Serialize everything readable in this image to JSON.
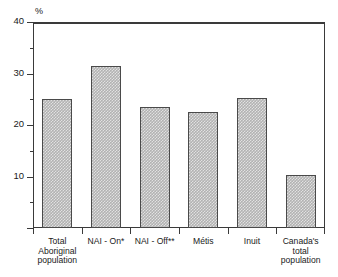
{
  "chart_data": {
    "type": "bar",
    "title": "",
    "subtitle": "",
    "xlabel": "",
    "ylabel": "%",
    "unit_label": "%",
    "categories": [
      "Total Aboriginal population",
      "NAI - On*",
      "NAI - Off**",
      "Métis",
      "Inuit",
      "Canada's total population"
    ],
    "category_lines": [
      [
        "Total",
        "Aboriginal",
        "population"
      ],
      [
        "NAI - On*"
      ],
      [
        "NAI - Off**"
      ],
      [
        "Métis"
      ],
      [
        "Inuit"
      ],
      [
        "Canada's",
        "total",
        "population"
      ]
    ],
    "values": [
      25.0,
      31.5,
      23.5,
      22.5,
      25.2,
      10.3
    ],
    "ylim": [
      0,
      40
    ],
    "y_major_ticks": [
      0,
      10,
      20,
      30,
      40
    ],
    "y_major_tick_labels": [
      "",
      "10",
      "20",
      "30",
      "40"
    ],
    "y_minor_ticks": [
      5,
      15,
      25,
      35
    ],
    "grid": false,
    "legend": "none",
    "bar_color": "#b2b2b2",
    "bar_border_color": "#4a4a4a",
    "axis_color": "#3a3a3a"
  },
  "figure": {
    "unit": "%",
    "title_fragment": ""
  }
}
